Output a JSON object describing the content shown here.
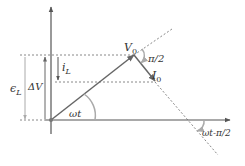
{
  "diagram": {
    "colors": {
      "axis": "#555555",
      "phasor": "#666666",
      "dotted": "#888888",
      "arc": "#aaaaaa",
      "emf_arrow": "#aaaaaa",
      "text": "#333333"
    },
    "labels": {
      "V0_main": "V",
      "V0_sub": "0",
      "I0_main": "I",
      "I0_sub": "0",
      "pi_over_2": "π/2",
      "iL_main": "i",
      "iL_sub": "L",
      "epsL_main": "ϵ",
      "epsL_sub": "L",
      "deltaV": "ΔV",
      "omega_t": "ωt",
      "omega_t_minus_pi2": "ωt-π/2"
    }
  }
}
